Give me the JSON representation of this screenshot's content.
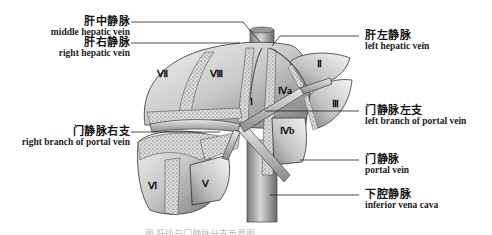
{
  "figure": {
    "caption": "图 肝段与门静脉分支示意图"
  },
  "labels": {
    "middle_hepatic_vein": {
      "zh": "肝中静脉",
      "en": "middle hepatic vein"
    },
    "right_hepatic_vein": {
      "zh": "肝右静脉",
      "en": "right hepatic vein"
    },
    "left_hepatic_vein": {
      "zh": "肝左静脉",
      "en": "left hepatic vein"
    },
    "left_branch_portal_vein": {
      "zh": "门静脉左支",
      "en": "left branch of portal vein"
    },
    "right_branch_portal_vein": {
      "zh": "门静脉右支",
      "en": "right branch of portal vein"
    },
    "portal_vein": {
      "zh": "门静脉",
      "en": "portal vein"
    },
    "inferior_vena_cava": {
      "zh": "下腔静脉",
      "en": "inferior vena cava"
    }
  },
  "segments": [
    "Ⅰ",
    "Ⅱ",
    "Ⅲ",
    "Ⅳa",
    "Ⅳb",
    "Ⅴ",
    "Ⅵ",
    "Ⅶ",
    "Ⅷ"
  ],
  "colors": {
    "parenchyma_light": "#e6e6e6",
    "parenchyma_mid": "#b5b5b5",
    "parenchyma_dark": "#6e6e6e",
    "stipple_band": "#cfcfcf",
    "vessel": "#9a9a9a",
    "line": "#222222"
  }
}
